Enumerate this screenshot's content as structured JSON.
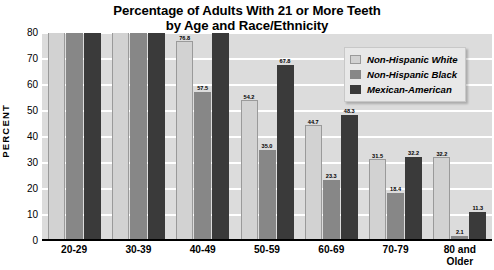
{
  "chart_data": {
    "type": "bar",
    "title": "Percentage of Adults With 21 or More Teeth by Age and Race/Ethnicity",
    "title_line1": "Percentage of Adults With 21 or More Teeth",
    "title_line2": "by Age and Race/Ethnicity",
    "xlabel": "",
    "ylabel": "PERCENT",
    "ylim": [
      0,
      80
    ],
    "yticks": [
      0,
      10,
      20,
      30,
      40,
      50,
      60,
      70,
      80
    ],
    "ytick_labels": [
      "0",
      "10",
      "20",
      "30",
      "40",
      "50",
      "60",
      "70",
      "80"
    ],
    "grid": true,
    "grid_axis": "y",
    "legend_position": "top-right",
    "categories": [
      "20-29",
      "30-39",
      "40-49",
      "50-59",
      "60-69",
      "70-79",
      "80 and Older"
    ],
    "category_label_lines": [
      [
        "20-29"
      ],
      [
        "30-39"
      ],
      [
        "40-49"
      ],
      [
        "50-59"
      ],
      [
        "60-69"
      ],
      [
        "70-79"
      ],
      [
        "80 and",
        "Older"
      ]
    ],
    "series": [
      {
        "name": "Non-Hispanic White",
        "color": "#d2d2d2",
        "values": [
          96.5,
          99.2,
          76.8,
          54.2,
          44.7,
          31.5,
          32.2
        ],
        "labels": [
          "96.5",
          "99.2",
          "76.8",
          "54.2",
          "44.7",
          "31.5",
          "32.2"
        ]
      },
      {
        "name": "Non-Hispanic Black",
        "color": "#878787",
        "values": [
          97.8,
          81.5,
          57.5,
          35.0,
          23.3,
          18.4,
          2.1
        ],
        "labels": [
          "97.8",
          "81.5",
          "57.5",
          "35.0",
          "23.3",
          "18.4",
          "2.1"
        ]
      },
      {
        "name": "Mexican-American",
        "color": "#3a3a3a",
        "values": [
          99.2,
          86.0,
          85.2,
          67.8,
          48.3,
          32.2,
          11.3
        ],
        "labels": [
          "99.2",
          "86.0",
          "85.2",
          "67.8",
          "48.3",
          "32.2",
          "11.3"
        ]
      }
    ]
  },
  "colors": {
    "plot_background": "#dcdcdc",
    "gridline": "#ffffff",
    "axis": "#000000",
    "series_white": "#d2d2d2",
    "series_black": "#878787",
    "series_mexican": "#3a3a3a",
    "legend_background": "#e8e8e8"
  }
}
